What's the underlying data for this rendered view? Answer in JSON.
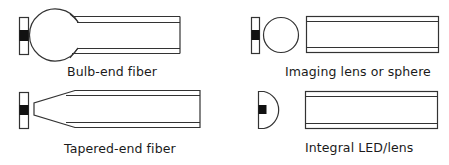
{
  "diagram": {
    "panels": [
      {
        "id": "bulb-end-fiber",
        "label": "Bulb-end fiber"
      },
      {
        "id": "imaging-lens",
        "label": "Imaging lens or sphere"
      },
      {
        "id": "tapered-end-fiber",
        "label": "Tapered-end fiber"
      },
      {
        "id": "integral-led-lens",
        "label": "Integral LED/lens"
      }
    ],
    "colors": {
      "line": "#333333",
      "emitter": "#111111",
      "background": "#ffffff"
    }
  }
}
